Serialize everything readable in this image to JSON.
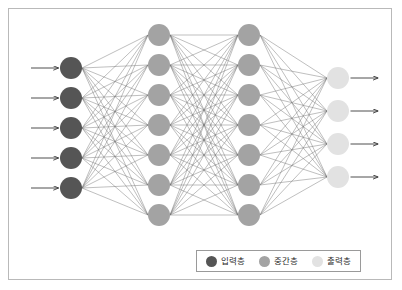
{
  "diagram": {
    "type": "fully-connected-neural-network",
    "background_color": "#ffffff",
    "frame_border_color": "#b9b9b9",
    "edge_color": "#6f6f6f",
    "arrow_color": "#3a3a3a",
    "layers": [
      {
        "id": "input",
        "label": "입력층",
        "node_count": 5,
        "color": "#555555",
        "radius": 11,
        "cx": 71,
        "cy_start": 68,
        "cy_step": 30,
        "has_input_arrows": true,
        "has_output_arrows": false
      },
      {
        "id": "hidden1",
        "label": "중간층",
        "node_count": 7,
        "color": "#a3a3a3",
        "radius": 11,
        "cx": 159,
        "cy_start": 35,
        "cy_step": 30,
        "has_input_arrows": false,
        "has_output_arrows": false
      },
      {
        "id": "hidden2",
        "label": "중간층",
        "node_count": 7,
        "color": "#a3a3a3",
        "radius": 11,
        "cx": 249,
        "cy_start": 35,
        "cy_step": 30,
        "has_input_arrows": false,
        "has_output_arrows": false
      },
      {
        "id": "output",
        "label": "출력층",
        "node_count": 4,
        "color": "#e2e2e2",
        "radius": 11,
        "cx": 338,
        "cy_start": 78,
        "cy_step": 33,
        "has_input_arrows": false,
        "has_output_arrows": true
      }
    ],
    "connections": [
      {
        "from": "input",
        "to": "hidden1"
      },
      {
        "from": "hidden1",
        "to": "hidden2"
      },
      {
        "from": "hidden2",
        "to": "output"
      }
    ]
  },
  "legend": {
    "items": [
      {
        "label": "입력층",
        "color": "#555555"
      },
      {
        "label": "중간층",
        "color": "#a3a3a3"
      },
      {
        "label": "출력층",
        "color": "#e2e2e2"
      }
    ]
  }
}
